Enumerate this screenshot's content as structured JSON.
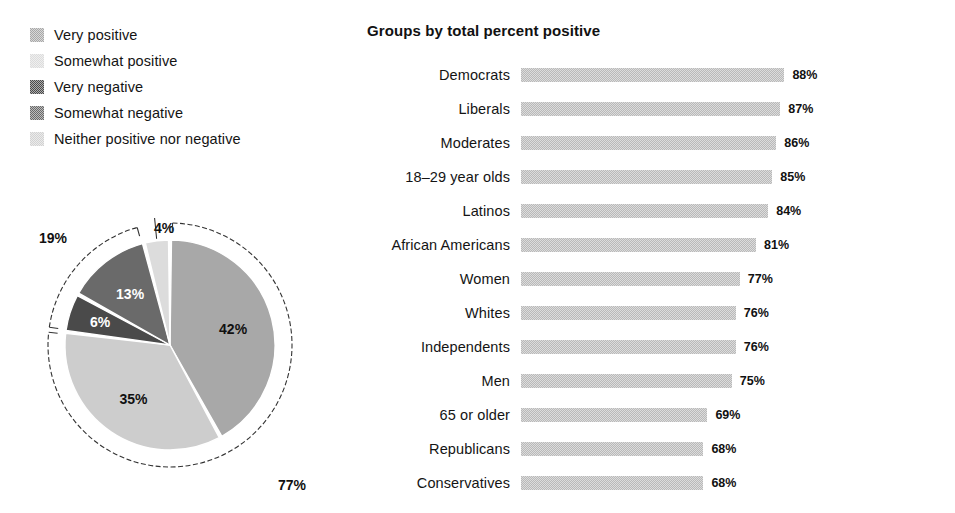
{
  "legend": {
    "items": [
      {
        "label": "Very positive",
        "color": "#a8a8a8",
        "swatch": "legend-swatch-very-positive"
      },
      {
        "label": "Somewhat positive",
        "color": "#dcdcdc",
        "swatch": "legend-swatch-somewhat-positive"
      },
      {
        "label": "Very negative",
        "color": "#4a4a4a",
        "swatch": "legend-swatch-very-negative"
      },
      {
        "label": "Somewhat negative",
        "color": "#6a6a6a",
        "swatch": "legend-swatch-somewhat-negative"
      },
      {
        "label": "Neither positive nor negative",
        "color": "#d2d2d2",
        "swatch": "legend-swatch-neither"
      }
    ]
  },
  "bar_section": {
    "title": "Groups by total percent positive"
  },
  "chart_data": [
    {
      "type": "pie",
      "title": "",
      "name": "overall-sentiment-pie",
      "labels": [
        "Very positive",
        "Somewhat positive",
        "Very negative",
        "Somewhat negative",
        "Neither positive nor negative"
      ],
      "values": [
        42,
        35,
        6,
        13,
        4
      ],
      "value_labels": [
        "42%",
        "35%",
        "6%",
        "13%",
        "4%"
      ],
      "colors": [
        "#a8a8a8",
        "#cdcdcd",
        "#4a4a4a",
        "#6a6a6a",
        "#dcdcdc"
      ],
      "label_text_colors": [
        "dark",
        "dark",
        "light",
        "light",
        "dark"
      ],
      "start_angle_deg": 0,
      "direction": "clockwise",
      "annotations": [
        {
          "label": "77%",
          "covers": [
            "Very positive",
            "Somewhat positive"
          ],
          "name": "pie-bracket-positive"
        },
        {
          "label": "19%",
          "covers": [
            "Very negative",
            "Somewhat negative"
          ],
          "name": "pie-bracket-negative"
        },
        {
          "label": "4%",
          "covers": [
            "Neither positive nor negative"
          ],
          "name": "pie-callout-neither"
        }
      ],
      "legend_position": "top-left"
    },
    {
      "type": "bar",
      "orientation": "horizontal",
      "name": "groups-by-total-percent-positive",
      "title": "Groups by total percent positive",
      "xlabel": "",
      "ylabel": "",
      "xlim": [
        0,
        100
      ],
      "grid": false,
      "bar_color": "#b9b9b9",
      "categories": [
        "Democrats",
        "Liberals",
        "Moderates",
        "18–29 year olds",
        "Latinos",
        "African Americans",
        "Women",
        "Whites",
        "Independents",
        "Men",
        "65 or older",
        "Republicans",
        "Conservatives"
      ],
      "values": [
        88,
        87,
        86,
        85,
        84,
        81,
        77,
        76,
        76,
        75,
        69,
        68,
        68
      ],
      "value_labels": [
        "88%",
        "87%",
        "86%",
        "85%",
        "84%",
        "81%",
        "77%",
        "76%",
        "76%",
        "75%",
        "69%",
        "68%",
        "68%"
      ]
    }
  ]
}
